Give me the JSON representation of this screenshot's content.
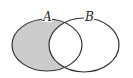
{
  "diagram": {
    "type": "venn",
    "sets": [
      {
        "label": "A",
        "shaded": true
      },
      {
        "label": "B",
        "shaded": false
      }
    ],
    "shaded_region": "A minus B",
    "colors": {
      "shade": "#cccccc",
      "stroke": "#333333",
      "background": "#ffffff"
    }
  }
}
